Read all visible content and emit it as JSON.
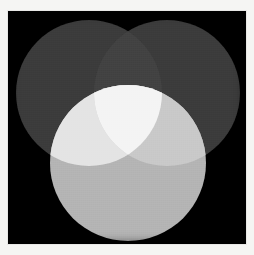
{
  "figure": {
    "background_color": "#000000",
    "canvas_border_color": "#e8e8e6",
    "page_background": "#f5f5f3"
  },
  "chart_data": {
    "type": "venn",
    "subtitle": "",
    "xlabel": "",
    "ylabel": "",
    "grid": false,
    "legend_position": "none",
    "background_color": "#000000",
    "blend_mode": "additive-light",
    "view_box": {
      "width": 238,
      "height": 233
    },
    "sets": [
      {
        "id": "A",
        "label": "",
        "position": "top-left",
        "cx": 81,
        "cy": 82,
        "r": 73,
        "fill": "#3a3a3a",
        "opacity": 1.0
      },
      {
        "id": "B",
        "label": "",
        "position": "top-right",
        "cx": 159,
        "cy": 82,
        "r": 73,
        "fill": "#3a3a3a",
        "opacity": 1.0
      },
      {
        "id": "C",
        "label": "",
        "position": "bottom-center",
        "cx": 120,
        "cy": 152,
        "r": 78,
        "fill": "#b4b4b4",
        "opacity": 1.0
      }
    ],
    "regions": [
      {
        "id": "outside",
        "sets": [],
        "fill": "#000000",
        "description": "background outside all circles"
      },
      {
        "id": "A_only",
        "sets": [
          "A"
        ],
        "fill": "#3a3a3a",
        "description": "top-left circle only"
      },
      {
        "id": "B_only",
        "sets": [
          "B"
        ],
        "fill": "#3a3a3a",
        "description": "top-right circle only"
      },
      {
        "id": "C_only",
        "sets": [
          "C"
        ],
        "fill": "#b4b4b4",
        "description": "bottom circle only"
      },
      {
        "id": "AB",
        "sets": [
          "A",
          "B"
        ],
        "fill": "#434343",
        "description": "top two circles overlap"
      },
      {
        "id": "AC",
        "sets": [
          "A",
          "C"
        ],
        "fill": "#e4e4e4",
        "description": "left pair overlap"
      },
      {
        "id": "BC",
        "sets": [
          "B",
          "C"
        ],
        "fill": "#c9c9c9",
        "description": "right pair overlap"
      },
      {
        "id": "ABC",
        "sets": [
          "A",
          "B",
          "C"
        ],
        "fill": "#f4f4f4",
        "description": "center triple overlap"
      }
    ],
    "annotations": []
  }
}
